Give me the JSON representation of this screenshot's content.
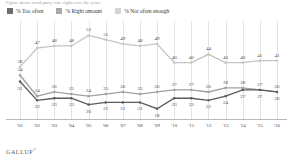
{
  "subtitle": "Figure shows trend party vote rights over the years",
  "legend": [
    {
      "label": "% Too often",
      "color": "#6e6e6e"
    },
    {
      "label": "% Right amount",
      "color": "#a8a8a8"
    },
    {
      "label": "% Not often enough",
      "color": "#d3d3d3"
    }
  ],
  "brand": "GALLUP",
  "brand_mark": "®",
  "chart_data": {
    "type": "line",
    "title": "",
    "subtitle": "Figure shows trend party vote rights over the years",
    "xlabel": "",
    "ylabel": "",
    "ylim": [
      15,
      58
    ],
    "grid": true,
    "legend_position": "top-left",
    "categories": [
      "'01",
      "'02",
      "'03",
      "'04",
      "'05",
      "'06",
      "'07",
      "'08",
      "'09",
      "'10",
      "'11",
      "'12",
      "'13",
      "'14",
      "'15",
      "'16"
    ],
    "series": [
      {
        "name": "% Not often enough",
        "color": "#c4c4c4",
        "values": [
          38,
          47,
          48,
          48,
          53,
          51,
          49,
          48,
          49,
          40,
          40,
          44,
          40,
          40,
          41,
          41
        ]
      },
      {
        "name": "% Right amount",
        "color": "#a0a0a0",
        "values": [
          34,
          24,
          26,
          25,
          24,
          25,
          26,
          25,
          26,
          27,
          27,
          26,
          28,
          28,
          27,
          26
        ]
      },
      {
        "name": "% Too often",
        "color": "#5a5a5a",
        "values": [
          31,
          22,
          23,
          23,
          20,
          21,
          21,
          21,
          18,
          23,
          23,
          22,
          24,
          27,
          27,
          26
        ]
      }
    ]
  }
}
